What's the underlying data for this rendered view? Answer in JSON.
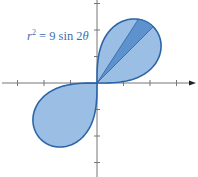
{
  "figure": {
    "equation": {
      "lhs_var": "r",
      "lhs_exp": "2",
      "rhs": "= 9 sin 2",
      "rhs_var": "θ"
    },
    "colors": {
      "lobe_fill": "#9bbfe4",
      "lobe_stroke": "#2c64a8",
      "wedge_fill": "#5d92cf",
      "axis": "#777777"
    },
    "scale_px_per_unit": 26.5,
    "origin_px": [
      97,
      83
    ],
    "x_ticks": [
      -3,
      -2,
      -1,
      1,
      2,
      3
    ],
    "y_ticks": [
      -3,
      -2,
      -1,
      1,
      2,
      3
    ],
    "shaded_wedge_deg": [
      45,
      57
    ]
  },
  "chart_data": {
    "type": "polar",
    "curve": "lemniscate r = 3*sqrt(sin 2θ)",
    "lobes": [
      "first quadrant (0 to π/2)",
      "third quadrant (π to 3π/2)"
    ],
    "max_r": 3,
    "highlighted_sector_deg": [
      45,
      57
    ],
    "xlim": [
      -3.5,
      3.6
    ],
    "ylim": [
      -3.3,
      3.1
    ],
    "grid": false
  }
}
